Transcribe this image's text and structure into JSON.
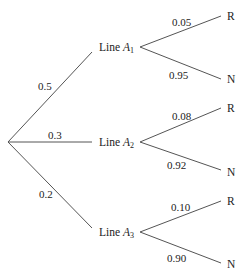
{
  "diagram": {
    "type": "probability-tree",
    "root": {
      "x": 8,
      "y": 142
    },
    "first_level": [
      {
        "label_prefix": "Line ",
        "label_var": "A",
        "label_sub": "1",
        "prob": "0.5",
        "children": [
          {
            "label": "R",
            "prob": "0.05"
          },
          {
            "label": "N",
            "prob": "0.95"
          }
        ]
      },
      {
        "label_prefix": "Line ",
        "label_var": "A",
        "label_sub": "2",
        "prob": "0.3",
        "children": [
          {
            "label": "R",
            "prob": "0.08"
          },
          {
            "label": "N",
            "prob": "0.92"
          }
        ]
      },
      {
        "label_prefix": "Line ",
        "label_var": "A",
        "label_sub": "3",
        "prob": "0.2",
        "children": [
          {
            "label": "R",
            "prob": "0.10"
          },
          {
            "label": "N",
            "prob": "0.90"
          }
        ]
      }
    ],
    "line_color": "#555555"
  }
}
